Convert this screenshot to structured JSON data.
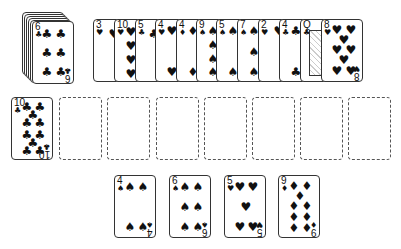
{
  "game": "Solitaire",
  "stock": {
    "depth_cards": 5,
    "top_card": {
      "rank": "6",
      "suit": "♣"
    }
  },
  "waste_fan": [
    {
      "rank": "3",
      "suit": "♥"
    },
    {
      "rank": "10",
      "suit": "♥"
    },
    {
      "rank": "5",
      "suit": "♣"
    },
    {
      "rank": "4",
      "suit": "♥"
    },
    {
      "rank": "4",
      "suit": "♦"
    },
    {
      "rank": "9",
      "suit": "♠"
    },
    {
      "rank": "5",
      "suit": "♠"
    },
    {
      "rank": "7",
      "suit": "♠"
    },
    {
      "rank": "2",
      "suit": "♥"
    },
    {
      "rank": "4",
      "suit": "♣"
    },
    {
      "rank": "Q",
      "suit": "♣"
    },
    {
      "rank": "8",
      "suit": "♥"
    }
  ],
  "row2": {
    "card": {
      "rank": "10",
      "suit": "♣"
    },
    "empty_slots": 7
  },
  "bottom_row": [
    {
      "rank": "4",
      "suit": "♠"
    },
    {
      "rank": "6",
      "suit": "♠"
    },
    {
      "rank": "5",
      "suit": "♥"
    },
    {
      "rank": "9",
      "suit": "♦"
    }
  ],
  "colors": {
    "ink": "#111111",
    "border": "#333333",
    "background": "#ffffff"
  }
}
